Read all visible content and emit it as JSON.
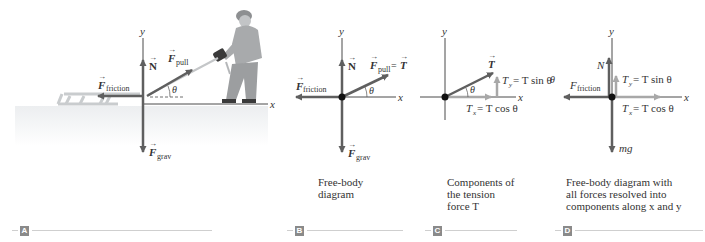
{
  "panels": [
    {
      "id": "A",
      "tag": "A",
      "caption": [],
      "axis_labels": {
        "x": "x",
        "y": "y"
      },
      "angle_label": "θ",
      "forces": [
        {
          "name": "N",
          "label": "N",
          "sub": "",
          "direction": "up"
        },
        {
          "name": "F_pull",
          "label": "F",
          "sub": "pull",
          "direction": "up-right at angle θ"
        },
        {
          "name": "F_friction",
          "label": "F",
          "sub": "friction",
          "direction": "left"
        },
        {
          "name": "F_grav",
          "label": "F",
          "sub": "grav",
          "direction": "down"
        }
      ],
      "scene": "Person on snow pulling a sled with a rope"
    },
    {
      "id": "B",
      "tag": "B",
      "caption": [
        "Free-body",
        "diagram"
      ],
      "axis_labels": {
        "x": "x",
        "y": "y"
      },
      "angle_label": "θ",
      "forces": [
        {
          "name": "N",
          "label": "N",
          "sub": "",
          "direction": "up"
        },
        {
          "name": "F_pull",
          "label": "F",
          "sub": "pull",
          "suffix": " = T",
          "direction": "up-right at angle θ"
        },
        {
          "name": "F_friction",
          "label": "F",
          "sub": "friction",
          "direction": "left"
        },
        {
          "name": "F_grav",
          "label": "F",
          "sub": "grav",
          "direction": "down"
        }
      ]
    },
    {
      "id": "C",
      "tag": "C",
      "caption": [
        "Components of",
        "the tension",
        "force T"
      ],
      "axis_labels": {
        "x": "x",
        "y": "y"
      },
      "angle_label": "θ",
      "vector_label": "T",
      "components": {
        "y": {
          "label": "T",
          "sub": "y",
          "eq": " = T sin θ"
        },
        "x": {
          "label": "T",
          "sub": "x",
          "eq": " = T cos θ"
        }
      }
    },
    {
      "id": "D",
      "tag": "D",
      "caption": [
        "Free-body diagram with",
        "all forces resolved into",
        "components along x and y"
      ],
      "axis_labels": {
        "x": "x",
        "y": "y"
      },
      "left_edge_label": "θ",
      "forces": [
        {
          "name": "N",
          "label": "N"
        },
        {
          "name": "F_friction",
          "label": "F",
          "sub": "friction"
        },
        {
          "name": "mg",
          "label": "mg"
        }
      ],
      "components": {
        "y": {
          "label": "T",
          "sub": "y",
          "eq": " = T sin θ"
        },
        "x": {
          "label": "T",
          "sub": "x",
          "eq": " = T cos θ"
        }
      }
    }
  ],
  "colors": {
    "force_arrow": "#5f5f5f",
    "component_arrow": "#9a9a9a",
    "axis": "#4a4a4a",
    "dot": "#111111",
    "snow": "#f0f1f2",
    "tag_box": "#8a8a8a"
  }
}
